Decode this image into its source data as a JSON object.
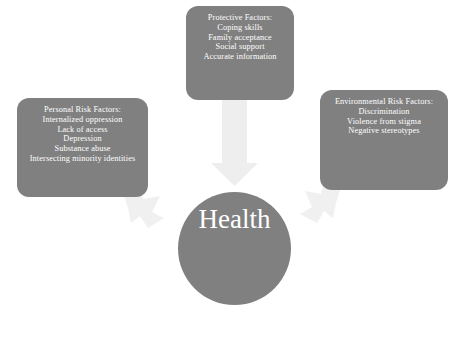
{
  "diagram": {
    "title_circle": "Health",
    "colors": {
      "box_fill": "#808080",
      "circle_fill": "#808080",
      "arrow_fill": "#eeeeee",
      "text": "#ffffff",
      "background": "#ffffff"
    },
    "boxes": {
      "protective": {
        "heading": "Protective Factors:",
        "items": [
          "Coping skills",
          "Family acceptance",
          "Social support",
          "Accurate information"
        ]
      },
      "personal": {
        "heading": "Personal Risk Factors:",
        "items": [
          "Internalized oppression",
          "Lack of access",
          "Depression",
          "Substance abuse",
          "Intersecting minority identities"
        ]
      },
      "environmental": {
        "heading": "Environmental Risk Factors:",
        "items": [
          "Discrimination",
          "Violence from stigma",
          "Negative stereotypes"
        ]
      }
    },
    "arrows": [
      {
        "name": "arrow-protective-to-health",
        "direction": "down"
      },
      {
        "name": "arrow-personal-to-health",
        "direction": "down-right"
      },
      {
        "name": "arrow-environmental-to-health",
        "direction": "down-left"
      }
    ]
  }
}
